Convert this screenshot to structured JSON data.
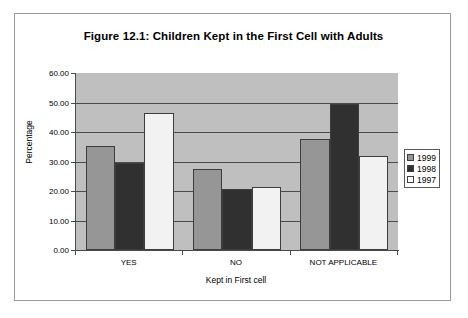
{
  "chart_data": {
    "type": "bar",
    "title": "Figure 12.1: Children Kept in the First Cell with Adults",
    "xlabel": "Kept in First cell",
    "ylabel": "Percentage",
    "categories": [
      "YES",
      "NO",
      "NOT APPLICABLE"
    ],
    "series": [
      {
        "name": "1999",
        "color": "#969696",
        "values": [
          35.4,
          27.6,
          37.8
        ]
      },
      {
        "name": "1998",
        "color": "#303030",
        "values": [
          29.6,
          20.8,
          49.5
        ]
      },
      {
        "name": "1997",
        "color": "#f2f2f2",
        "values": [
          46.4,
          21.5,
          31.9
        ]
      }
    ],
    "ylim": [
      0,
      60
    ],
    "ytick_labels": [
      "0.00",
      "10.00",
      "20.00",
      "30.00",
      "40.00",
      "50.00",
      "60.00"
    ],
    "ytick_values": [
      0,
      10,
      20,
      30,
      40,
      50,
      60
    ],
    "grid": true,
    "legend_position": "right",
    "plot_background": "#bfbfbf"
  },
  "legend": {
    "entries": [
      {
        "label": "1999"
      },
      {
        "label": "1998"
      },
      {
        "label": "1997"
      }
    ]
  }
}
